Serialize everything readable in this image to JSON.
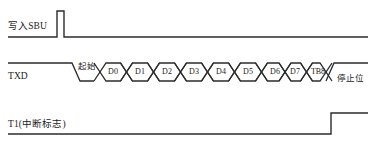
{
  "diagram": {
    "line_color": "#2b2b2b",
    "text_color": "#1a1a1a",
    "background": "#ffffff",
    "signals": [
      {
        "id": "sbu",
        "label": "写入SBU",
        "type": "pulse",
        "baseline_y": 37,
        "high_y": 11,
        "pulse_start_x": 57,
        "pulse_end_x": 64,
        "line_start_x": 8,
        "line_end_x": 368
      },
      {
        "id": "txd",
        "label": "TXD",
        "type": "data-frame",
        "high_y": 63,
        "low_y": 81,
        "idle_start_x": 8,
        "fall_start_x": 72,
        "fall_end_x": 80,
        "frame_start_x": 100,
        "rise_start_x": 326,
        "rise_end_x": 334,
        "line_end_x": 368,
        "start_bit_label": "起始",
        "stop_bit_label": "停止位",
        "bit_pitch": 27,
        "bit_slope": 6
      },
      {
        "id": "ti",
        "label": "T1(中断标志)",
        "type": "step",
        "baseline_y": 134,
        "high_y": 113,
        "rise_x": 331,
        "line_start_x": 8,
        "line_end_x": 368
      }
    ],
    "data_bits": [
      {
        "name": "D0",
        "center_x": 113
      },
      {
        "name": "D1",
        "center_x": 140
      },
      {
        "name": "D2",
        "center_x": 167
      },
      {
        "name": "D3",
        "center_x": 194
      },
      {
        "name": "D4",
        "center_x": 221
      },
      {
        "name": "D5",
        "center_x": 248
      },
      {
        "name": "D6",
        "center_x": 275
      },
      {
        "name": "D7",
        "center_x": 295
      },
      {
        "name": "TB8",
        "center_x": 318
      }
    ]
  }
}
